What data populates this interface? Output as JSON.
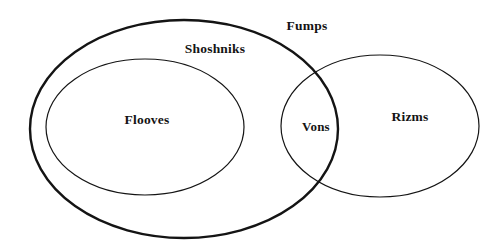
{
  "diagram": {
    "type": "euler-diagram",
    "background_color": "#ffffff",
    "stroke_color": "#141414",
    "text_color": "#141414",
    "canvas": {
      "width": 503,
      "height": 251
    },
    "sets": [
      {
        "id": "fumps",
        "label": "Fumps",
        "shape": "ellipse",
        "cx": 184,
        "cy": 129,
        "rx": 154,
        "ry": 109,
        "stroke_width": 2.4,
        "label_x": 307,
        "label_y": 27,
        "label_position": "top-right-inside",
        "contains": [
          "shoshniks",
          "flooves",
          "vons"
        ]
      },
      {
        "id": "shoshniks",
        "label": "Shoshniks",
        "shape": "ellipse",
        "cx": 145,
        "cy": 127,
        "rx": 99,
        "ry": 68,
        "stroke_width": 1.2,
        "label_x": 215,
        "label_y": 50,
        "label_position": "above-ellipse",
        "contains": [
          "flooves"
        ]
      },
      {
        "id": "rizms",
        "label": "Rizms",
        "shape": "ellipse",
        "cx": 380,
        "cy": 126,
        "rx": 99,
        "ry": 71,
        "stroke_width": 1.2,
        "label_x": 410,
        "label_y": 118,
        "label_position": "center-right",
        "contains": [
          "vons"
        ]
      }
    ],
    "inner_labels": [
      {
        "id": "flooves",
        "label": "Flooves",
        "x": 147,
        "y": 121,
        "inside_of": [
          "shoshniks",
          "fumps"
        ]
      },
      {
        "id": "vons",
        "label": "Vons",
        "x": 316,
        "y": 128,
        "inside_of": [
          "fumps",
          "rizms"
        ],
        "region": "intersection"
      }
    ],
    "intersections": [
      {
        "between": [
          "fumps",
          "rizms"
        ],
        "points": [
          [
            318,
            65
          ],
          [
            318,
            186
          ]
        ],
        "label": "Vons"
      }
    ]
  }
}
